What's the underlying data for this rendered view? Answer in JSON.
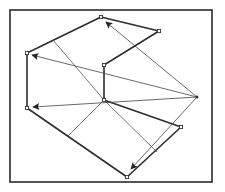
{
  "diagram": {
    "type": "geometric-construction",
    "colors": {
      "stroke": "#2e2e2e",
      "thin": "#555555",
      "background": "#ffffff"
    },
    "frame": {
      "x": 10,
      "y": 10,
      "width": 202,
      "height": 172
    },
    "hub": {
      "name": "hub",
      "x": 197,
      "y": 97
    },
    "vertices": [
      {
        "name": "top",
        "x": 101,
        "y": 17
      },
      {
        "name": "top-right",
        "x": 159,
        "y": 31
      },
      {
        "name": "inner",
        "x": 104,
        "y": 65
      },
      {
        "name": "center",
        "x": 104,
        "y": 100
      },
      {
        "name": "right",
        "x": 181,
        "y": 127
      },
      {
        "name": "bottom",
        "x": 127,
        "y": 177
      },
      {
        "name": "bottom-left",
        "x": 27,
        "y": 108
      },
      {
        "name": "left",
        "x": 27,
        "y": 53
      }
    ],
    "arrows": [
      {
        "from": "hub",
        "to": "top",
        "x1": 197,
        "y1": 97,
        "x2": 106,
        "y2": 22
      },
      {
        "from": "hub",
        "to": "left",
        "x1": 197,
        "y1": 97,
        "x2": 32,
        "y2": 55
      },
      {
        "from": "hub",
        "to": "bottom-left",
        "x1": 197,
        "y1": 97,
        "x2": 33,
        "y2": 107
      },
      {
        "from": "hub",
        "to": "bottom",
        "x1": 197,
        "y1": 97,
        "x2": 131,
        "y2": 169
      }
    ],
    "connectors": [
      {
        "x1": 53,
        "y1": 40,
        "x2": 104,
        "y2": 100
      },
      {
        "x1": 104,
        "y1": 100,
        "x2": 68,
        "y2": 136
      },
      {
        "x1": 104,
        "y1": 100,
        "x2": 157,
        "y2": 152
      }
    ]
  }
}
